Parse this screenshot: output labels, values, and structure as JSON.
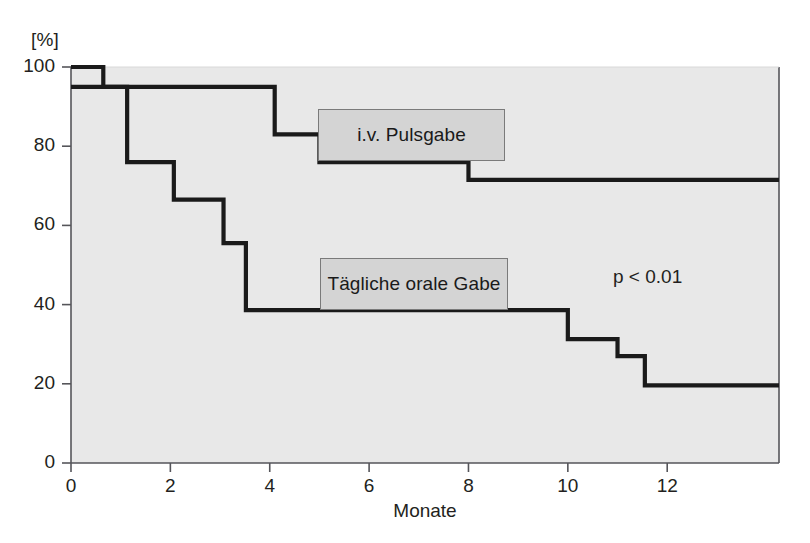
{
  "chart_data": {
    "type": "line",
    "subtype": "kaplan-meier-step",
    "title": "",
    "xlabel": "Monate",
    "ylabel": "[%]",
    "yunit": "[%]",
    "xlim": [
      0,
      14.25
    ],
    "ylim": [
      0,
      100
    ],
    "xticks": [
      0,
      2,
      4,
      6,
      8,
      10,
      12
    ],
    "xtick_labels": [
      "0",
      "2",
      "4",
      "6",
      "8",
      "10",
      "12"
    ],
    "yticks": [
      0,
      20,
      40,
      60,
      80,
      100
    ],
    "ytick_labels": [
      "0",
      "20",
      "40",
      "60",
      "80",
      "100"
    ],
    "grid": false,
    "legend_position": "inline-callout",
    "plot_background": "#e8e8e8",
    "line_color": "#1a1a1a",
    "series": [
      {
        "name": "i.v. Pulsgabe",
        "label_box": {
          "x_px": 318,
          "y_px": 109,
          "w_px": 187,
          "h_px": 52
        },
        "steps": [
          {
            "x": 0.0,
            "y": 100
          },
          {
            "x": 0.65,
            "y": 95
          },
          {
            "x": 4.1,
            "y": 83
          },
          {
            "x": 5.0,
            "y": 76
          },
          {
            "x": 8.0,
            "y": 71.5
          },
          {
            "x": 14.25,
            "y": 71.5
          }
        ]
      },
      {
        "name": "Tägliche orale Gabe",
        "label_box": {
          "x_px": 320,
          "y_px": 258,
          "w_px": 188,
          "h_px": 52
        },
        "steps": [
          {
            "x": 0.0,
            "y": 95
          },
          {
            "x": 1.13,
            "y": 76
          },
          {
            "x": 2.07,
            "y": 66.5
          },
          {
            "x": 3.07,
            "y": 55.5
          },
          {
            "x": 3.52,
            "y": 38.6
          },
          {
            "x": 10.0,
            "y": 31.3
          },
          {
            "x": 11.0,
            "y": 27.0
          },
          {
            "x": 11.55,
            "y": 19.6
          },
          {
            "x": 14.25,
            "y": 19.6
          }
        ]
      }
    ],
    "annotations": [
      {
        "text": "p < 0.01",
        "x_px": 613,
        "y_px": 266
      }
    ]
  },
  "axes": {
    "y_unit_label": "[%]",
    "x_axis_title": "Monate"
  }
}
